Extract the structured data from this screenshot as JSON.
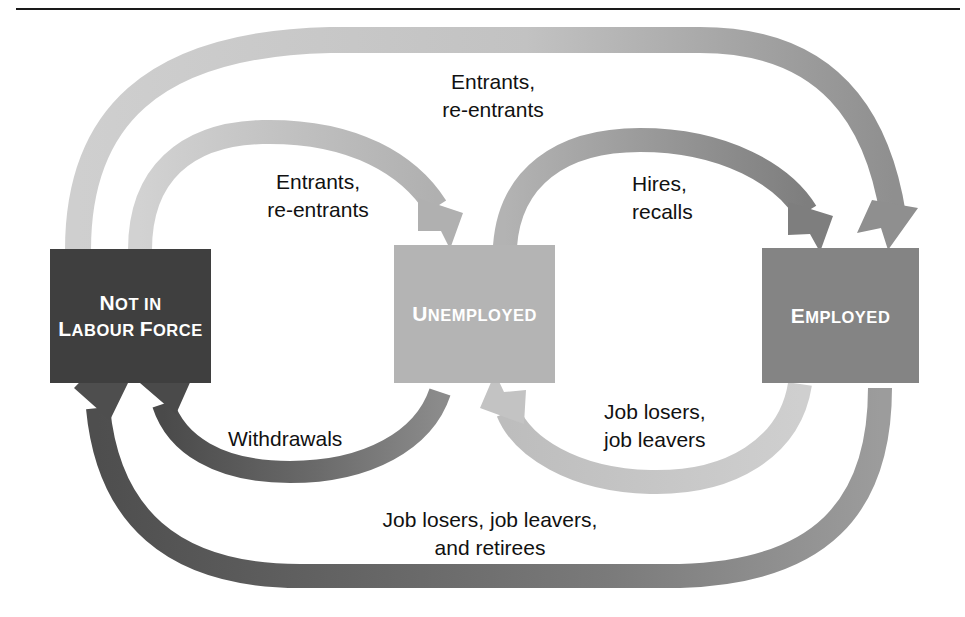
{
  "diagram": {
    "colors": {
      "nilf_box": "#3f3f3f",
      "unemployed_box": "#b4b4b4",
      "employed_box": "#848484",
      "arrow_light": "#c9c9c9",
      "arrow_mid": "#9a9a9a",
      "arrow_dark": "#4f4f4f",
      "text_dark": "#111111",
      "text_light": "#ffffff",
      "background": "#ffffff"
    },
    "boxes": [
      {
        "id": "not-in-labour-force",
        "line1": "Not in",
        "line2": "Labour Force",
        "line1_initial": "N",
        "line1_rest": "OT IN",
        "line2_initial_a": "L",
        "line2_rest_a": "ABOUR ",
        "line2_initial_b": "F",
        "line2_rest_b": "ORCE"
      },
      {
        "id": "unemployed",
        "initial": "U",
        "rest": "NEMPLOYED"
      },
      {
        "id": "employed",
        "initial": "E",
        "rest": "MPLOYED"
      }
    ],
    "flows": [
      {
        "id": "entrants-reentrants-outer",
        "label": "Entrants,\nre-entrants",
        "from": "not-in-labour-force",
        "to": "employed",
        "shade": "light"
      },
      {
        "id": "entrants-reentrants-inner",
        "label": "Entrants,\nre-entrants",
        "from": "not-in-labour-force",
        "to": "unemployed",
        "shade": "light"
      },
      {
        "id": "hires-recalls",
        "label": "Hires,\nrecalls",
        "from": "unemployed",
        "to": "employed",
        "shade": "mid"
      },
      {
        "id": "job-losers-job-leavers",
        "label": "Job losers,\njob leavers",
        "from": "employed",
        "to": "unemployed",
        "shade": "light"
      },
      {
        "id": "withdrawals",
        "label": "Withdrawals",
        "from": "unemployed",
        "to": "not-in-labour-force",
        "shade": "dark"
      },
      {
        "id": "job-losers-leavers-retirees",
        "label": "Job losers, job leavers,\nand retirees",
        "from": "employed",
        "to": "not-in-labour-force",
        "shade": "dark"
      }
    ]
  }
}
